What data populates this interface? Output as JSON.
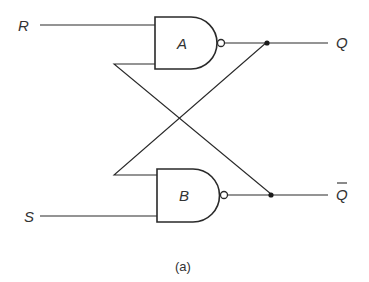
{
  "diagram": {
    "type": "SR latch (cross-coupled NAND gates)",
    "inputs": {
      "r_label": "R",
      "s_label": "S"
    },
    "gates": {
      "a_label": "A",
      "b_label": "B",
      "gate_type": "NAND"
    },
    "outputs": {
      "q_label": "Q",
      "qbar_label": "Q"
    },
    "caption": "(a)",
    "colors": {
      "line": "#2a2a2a",
      "text": "#333333",
      "background": "#ffffff"
    }
  }
}
